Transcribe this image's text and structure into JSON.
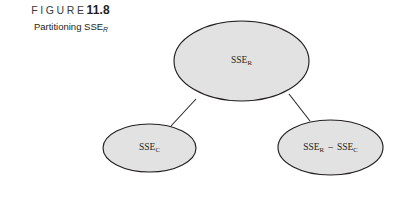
{
  "figure": {
    "label_word": "FIGURE",
    "number": "11.8",
    "subtitle_text": "Partitioning SSE",
    "subtitle_subscript": "R"
  },
  "diagram": {
    "type": "tree",
    "colors": {
      "node_fill": "#e2e2e2",
      "node_stroke": "#231f20",
      "connector": "#231f20",
      "background": "#ffffff",
      "text": "#231f20"
    },
    "nodes": [
      {
        "id": "root",
        "base": "SSE",
        "subscript": "R",
        "full_text": "SSE_R",
        "cx": 241.5,
        "cy": 61,
        "rx": 67.5,
        "ry": 40
      },
      {
        "id": "left",
        "base": "SSE",
        "subscript": "C",
        "full_text": "SSE_C",
        "cx": 149.5,
        "cy": 148,
        "rx": 46.5,
        "ry": 24
      },
      {
        "id": "right",
        "base_first": "SSE",
        "subscript_first": "R",
        "operator": "–",
        "base_second": "SSE",
        "subscript_second": "C",
        "full_text": "SSE_R – SSE_C",
        "cx": 330.5,
        "cy": 147.5,
        "rx": 52.5,
        "ry": 27.5
      }
    ],
    "edges": [
      {
        "id": "root-to-left",
        "from": "root",
        "to": "left",
        "x1": 196,
        "y1": 99,
        "x2": 171,
        "y2": 126
      },
      {
        "id": "root-to-right",
        "from": "root",
        "to": "right",
        "x1": 289,
        "y1": 94,
        "x2": 310,
        "y2": 121
      }
    ]
  }
}
